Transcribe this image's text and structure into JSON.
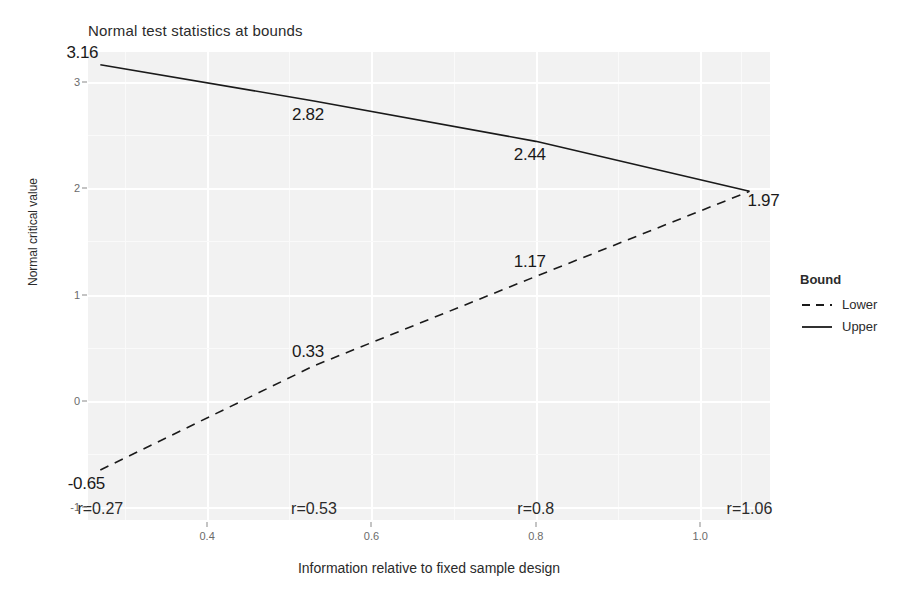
{
  "chart_data": {
    "type": "line",
    "title": "Normal test statistics at bounds",
    "xlabel": "Information relative to fixed sample design",
    "ylabel": "Normal critical value",
    "xlim": [
      0.255,
      1.085
    ],
    "ylim": [
      -1.12,
      3.28
    ],
    "x_ticks": [
      0.4,
      0.6,
      0.8,
      1.0
    ],
    "x_tick_labels": [
      "0.4",
      "0.6",
      "0.8",
      "1.0"
    ],
    "y_ticks": [
      -1,
      0,
      1,
      2,
      3
    ],
    "y_tick_labels": [
      "-1",
      "0",
      "1",
      "2",
      "3"
    ],
    "grid": true,
    "legend_position": "right",
    "legend_title": "Bound",
    "x": [
      0.27,
      0.53,
      0.8,
      1.06
    ],
    "series": [
      {
        "name": "Upper",
        "style": "solid",
        "values": [
          3.16,
          2.82,
          2.44,
          1.97
        ],
        "labels": [
          "3.16",
          "2.82",
          "2.44",
          "1.97"
        ]
      },
      {
        "name": "Lower",
        "style": "dashed",
        "values": [
          -0.65,
          0.33,
          1.17,
          1.97
        ],
        "labels": [
          "-0.65",
          "0.33",
          "1.17",
          "1.97"
        ]
      }
    ],
    "annotations": [
      {
        "text": "r=0.27",
        "x": 0.27,
        "y": -1.02
      },
      {
        "text": "r=0.53",
        "x": 0.53,
        "y": -1.02
      },
      {
        "text": "r=0.8",
        "x": 0.8,
        "y": -1.02
      },
      {
        "text": "r=1.06",
        "x": 1.06,
        "y": -1.02
      }
    ],
    "colors": {
      "panel_background": "#f2f2f2",
      "grid_major": "#ffffff",
      "line": "#1a1a1a",
      "text": "#2b2b2b"
    }
  },
  "legend": {
    "title": "Bound",
    "items": [
      {
        "label": "Lower",
        "style": "dashed"
      },
      {
        "label": "Upper",
        "style": "solid"
      }
    ]
  }
}
